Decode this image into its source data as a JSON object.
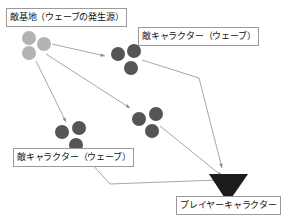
{
  "diagram": {
    "background_color": "#ffffff",
    "line_color": "#9d9d9d",
    "labels": [
      {
        "id": "enemy-base",
        "text": "敵基地（ウェーブの発生源）"
      },
      {
        "id": "enemy-wave-top",
        "text": "敵キャラクター（ウェーブ）"
      },
      {
        "id": "enemy-wave-bottom",
        "text": "敵キャラクター（ウェーブ）"
      },
      {
        "id": "player-character",
        "text": "プレイヤーキャラクター"
      }
    ],
    "enemy_base": {
      "color": "#b3b3b3",
      "units": [
        {
          "cx": 29,
          "cy": 38,
          "r": 7
        },
        {
          "cx": 44,
          "cy": 44,
          "r": 7
        },
        {
          "cx": 29,
          "cy": 53,
          "r": 7
        }
      ]
    },
    "enemy_waves": [
      {
        "id": "wave-top",
        "color": "#555555",
        "units": [
          {
            "cx": 118,
            "cy": 54,
            "r": 7
          },
          {
            "cx": 134,
            "cy": 51,
            "r": 7
          },
          {
            "cx": 131,
            "cy": 68,
            "r": 7
          }
        ]
      },
      {
        "id": "wave-lower-left",
        "color": "#555555",
        "units": [
          {
            "cx": 62,
            "cy": 132,
            "r": 7
          },
          {
            "cx": 79,
            "cy": 128,
            "r": 7
          },
          {
            "cx": 76,
            "cy": 145,
            "r": 7
          }
        ]
      },
      {
        "id": "wave-middle-right",
        "color": "#555555",
        "units": [
          {
            "cx": 139,
            "cy": 119,
            "r": 7
          },
          {
            "cx": 156,
            "cy": 114,
            "r": 7
          },
          {
            "cx": 152,
            "cy": 131,
            "r": 7
          }
        ]
      }
    ],
    "player": {
      "color": "#1c1c1c",
      "shape": "triangle-down",
      "points": "209,174 248,174 228,203"
    },
    "arrows": [
      {
        "id": "base-to-wave-top",
        "path": "M 52,44 L 105,56"
      },
      {
        "id": "base-to-wave-middle",
        "path": "M 46,54 L 130,108"
      },
      {
        "id": "base-to-wave-left",
        "path": "M 36,61 L 66,122"
      },
      {
        "id": "wave-top-to-player",
        "path": "M 142,60 L 199,78 L 222,168"
      },
      {
        "id": "wave-mid-to-player",
        "path": "M 160,126 L 222,176"
      },
      {
        "id": "wave-left-to-player",
        "path": "M 81,152 L 110,184 L 218,180"
      }
    ]
  }
}
